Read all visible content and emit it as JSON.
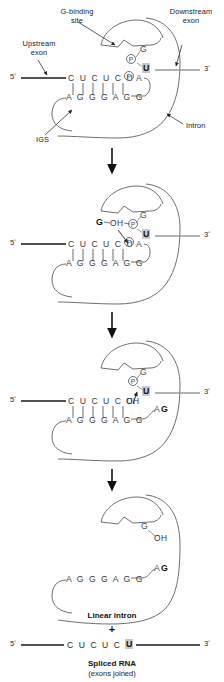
{
  "figure": {
    "colors": {
      "exon_line": "#1a1a1a",
      "downstream_exon_line": "#9a9a9a",
      "intron_outline": "#6f6f6f",
      "base_text": "#3a3a3a",
      "highlight_bg": "#c9c9c9",
      "arrow": "#111111"
    }
  },
  "labels": {
    "g_binding_site": "G-binding\nsite",
    "g_binding_site_line1": "G-binding",
    "g_binding_site_line2": "site",
    "upstream_exon_line1": "Upstream",
    "upstream_exon_line2": "exon",
    "downstream_exon_line1": "Downstream",
    "downstream_exon_line2": "exon",
    "intron": "Intron",
    "igs": "IGS",
    "linear_intron": "Linear intron",
    "plus": "+",
    "spliced_rna": "Spliced RNA",
    "exons_joined": "(exons joined)"
  },
  "panels": [
    {
      "id": "panel-1",
      "five_prime": "5ʹ",
      "three_prime": "3ʹ",
      "top_strand": "C U C U C U",
      "top_strand_tail": "A",
      "pairing_bars": 6,
      "igs_strand": "A G G G A G G",
      "guanosine": "G",
      "phosphate": "P",
      "splice_base": "U"
    },
    {
      "id": "panel-2",
      "five_prime": "5ʹ",
      "three_prime": "3ʹ",
      "top_strand": "C U C U C U",
      "top_strand_tail": "A",
      "pairing_bars": 6,
      "igs_strand": "A G G G A G G",
      "free_g": "G",
      "free_g_oh": "OH",
      "guanosine": "G",
      "phosphate": "P",
      "splice_base": "U"
    },
    {
      "id": "panel-3",
      "five_prime": "5ʹ",
      "three_prime": "3ʹ",
      "top_strand": "C U C U C U",
      "top_strand_oh": "OH",
      "pairing_bars": 6,
      "igs_strand": "A G G G A G G",
      "intron_5_end_a": "A",
      "intron_5_end_g": "G",
      "guanosine": "G",
      "phosphate": "P",
      "splice_base": "U"
    },
    {
      "id": "panel-4",
      "guanosine": "G",
      "guanosine_oh": "OH",
      "igs_strand": "A G G G A G G",
      "intron_5_end_a": "A",
      "intron_5_end_g": "G"
    }
  ],
  "product": {
    "five_prime": "5ʹ",
    "three_prime": "3ʹ",
    "sequence": "C U C U C U",
    "joined_base": "U"
  }
}
